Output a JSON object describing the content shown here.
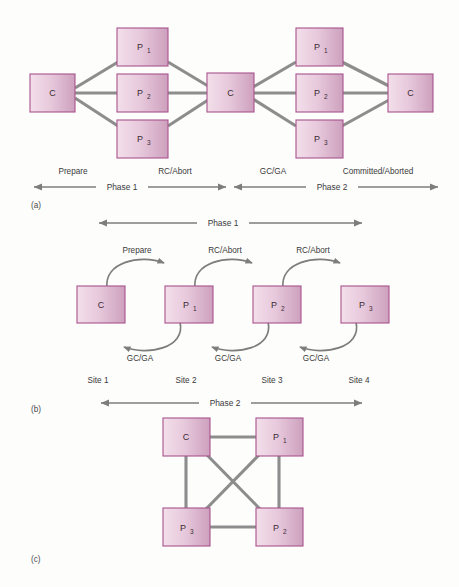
{
  "figure": {
    "background_color": "#fdfdfc",
    "box_fill_light": "#f0d8e4",
    "box_fill_dark": "#cfa3bd",
    "box_border_color": "#a8528c",
    "link_color": "#8d8d8d",
    "arrow_color": "#7d7d7d",
    "text_color": "#3a3a3a"
  },
  "parts": {
    "a": "(a)",
    "b": "(b)",
    "c": "(c)"
  },
  "panel_a": {
    "nodes": {
      "c_left": "C",
      "c_mid": "C",
      "c_right": "C",
      "p1_left_base": "P",
      "p1_left_sub": "1",
      "p2_left_base": "P",
      "p2_left_sub": "2",
      "p3_left_base": "P",
      "p3_left_sub": "3",
      "p1_right_base": "P",
      "p1_right_sub": "1",
      "p2_right_base": "P",
      "p2_right_sub": "2",
      "p3_right_base": "P",
      "p3_right_sub": "3"
    },
    "messages": {
      "prepare": "Prepare",
      "rc_abort": "RC/Abort",
      "gc_ga": "GC/GA",
      "committed_aborted": "Committed/Aborted"
    },
    "phases": {
      "phase1": "Phase 1",
      "phase2": "Phase 2"
    }
  },
  "panel_b": {
    "phase_top": "Phase 1",
    "phase_bottom": "Phase 2",
    "nodes": {
      "c_base": "C",
      "p1_base": "P",
      "p1_sub": "1",
      "p2_base": "P",
      "p2_sub": "2",
      "p3_base": "P",
      "p3_sub": "3"
    },
    "top_labels": [
      "Prepare",
      "RC/Abort",
      "RC/Abort"
    ],
    "bottom_labels": [
      "GC/GA",
      "GC/GA",
      "GC/GA"
    ],
    "sites": [
      "Site 1",
      "Site 2",
      "Site 3",
      "Site 4"
    ]
  },
  "panel_c": {
    "nodes": {
      "c_base": "C",
      "p1_base": "P",
      "p1_sub": "1",
      "p2_base": "P",
      "p2_sub": "2",
      "p3_base": "P",
      "p3_sub": "3"
    }
  }
}
